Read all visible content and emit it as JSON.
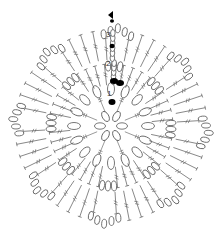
{
  "diagram": {
    "title": "Crochet motif chart",
    "round_labels": [
      "1",
      "2",
      "3"
    ],
    "colors": {
      "line": "#555555",
      "fill": "#ffffff",
      "marker": "#000000"
    },
    "center": [
      111,
      126
    ],
    "center_ring": {
      "radius": 11,
      "chains": 6
    },
    "round1": {
      "spokes": 8,
      "chain_ring_radius": 37,
      "chains": 16
    },
    "round2": {
      "stitches": 40,
      "inner_radius": 41,
      "outer_radius": 62,
      "chain_loops": 8
    },
    "round3": {
      "stitches": 48,
      "inner_radius": 66,
      "outer_radius": 96,
      "scallops": 8
    },
    "legend": {
      "start_marker": "triangle",
      "join_marker": "filled-oval"
    }
  }
}
